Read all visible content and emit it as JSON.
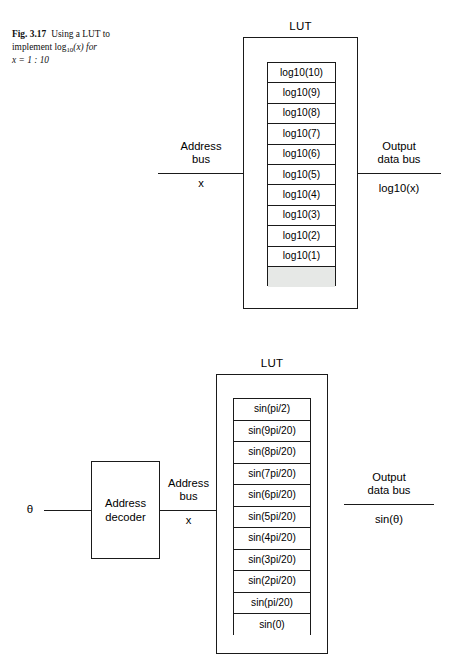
{
  "caption": {
    "fig_number": "Fig. 3.17",
    "text_part1": "Using a LUT to",
    "text_part2_pre": "implement log",
    "text_part2_sub": "10",
    "text_part2_post": "(x) for",
    "text_part3": "x = 1 : 10"
  },
  "figures": [
    {
      "id": "log-lut-figure",
      "title": "LUT",
      "input": {
        "bus_label_line1": "Address",
        "bus_label_line2": "bus",
        "bus_value": "x"
      },
      "output": {
        "bus_label_line1": "Output",
        "bus_label_line2": "data bus",
        "bus_value": "log10(x)"
      },
      "cells": [
        "log10(10)",
        "log10(9)",
        "log10(8)",
        "log10(7)",
        "log10(6)",
        "log10(5)",
        "log10(4)",
        "log10(3)",
        "log10(2)",
        "log10(1)",
        ""
      ]
    },
    {
      "id": "sine-lut-figure",
      "title": "LUT",
      "input_pin": "θ",
      "decoder": {
        "label_line1": "Address",
        "label_line2": "decoder"
      },
      "input": {
        "bus_label_line1": "Address",
        "bus_label_line2": "bus",
        "bus_value": "x"
      },
      "output": {
        "bus_label_line1": "Output",
        "bus_label_line2": "data bus",
        "bus_value": "sin(θ)"
      },
      "cells": [
        "sin(pi/2)",
        "sin(9pi/20)",
        "sin(8pi/20)",
        "sin(7pi/20)",
        "sin(6pi/20)",
        "sin(5pi/20)",
        "sin(4pi/20)",
        "sin(3pi/20)",
        "sin(2pi/20)",
        "sin(pi/20)",
        "sin(0)"
      ]
    }
  ]
}
